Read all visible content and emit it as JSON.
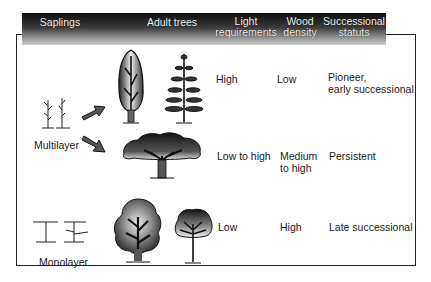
{
  "header": {
    "columns": [
      {
        "label": "Saplings"
      },
      {
        "label": "Adult trees"
      },
      {
        "label_line1": "Light",
        "label_line2": "requirements"
      },
      {
        "label_line1": "Wood",
        "label_line2": "density"
      },
      {
        "label_line1": "Successional",
        "label_line2": "statuts"
      }
    ]
  },
  "groups": {
    "multilayer": "Multilayer",
    "monolayer": "Monolayer"
  },
  "rows": [
    {
      "tree_icons": [
        "columnar-broadleaf-tree-icon",
        "tiered-conifer-tree-icon"
      ],
      "light": "High",
      "wood_density": "Low",
      "status_line1": "Pioneer,",
      "status_line2": "early successional"
    },
    {
      "tree_icons": [
        "umbrella-crown-tree-icon"
      ],
      "light": "Low to high",
      "wood_density_line1": "Medium",
      "wood_density_line2": "to high",
      "status_line1": "Persistent"
    },
    {
      "tree_icons": [
        "round-crown-tree-icon",
        "small-round-tree-icon"
      ],
      "light": "Low",
      "wood_density": "High",
      "status_line1": "Late successional"
    }
  ],
  "colors": {
    "header_dark": "#0d0d0d",
    "header_light": "#d0d0d0",
    "border": "#222222",
    "text": "#1a1a1a"
  }
}
